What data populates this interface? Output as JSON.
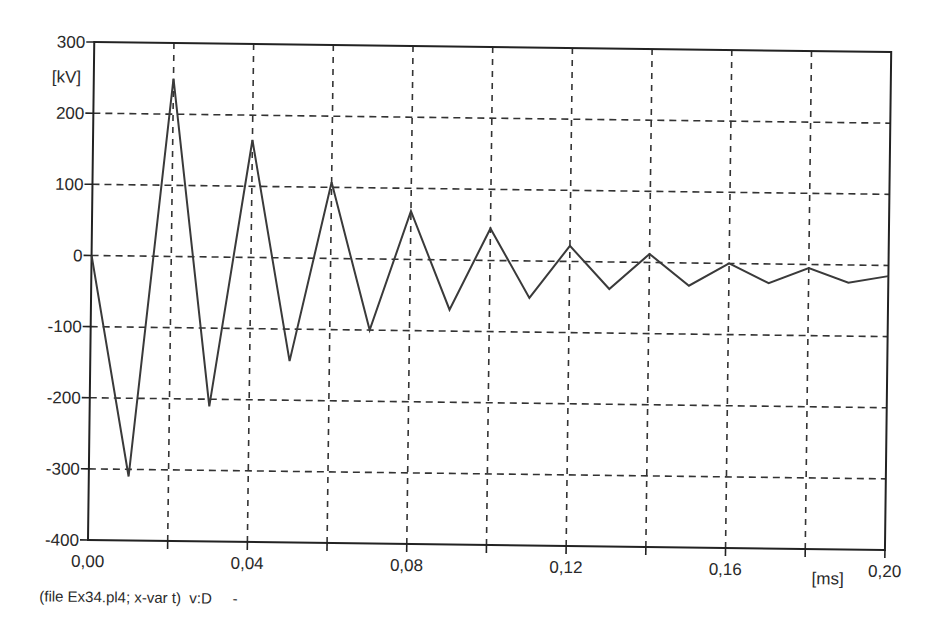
{
  "chart_data": {
    "type": "line",
    "title": "",
    "xlabel": "[ms]",
    "ylabel": "[kV]",
    "xlim": [
      0.0,
      0.2
    ],
    "ylim": [
      -400,
      300
    ],
    "grid": true,
    "x_ticks": [
      "0,00",
      "0,04",
      "0,08",
      "0,12",
      "0,16",
      "0,20"
    ],
    "x_tick_values": [
      0.0,
      0.04,
      0.08,
      0.12,
      0.16,
      0.2
    ],
    "x_gridlines": [
      0.02,
      0.04,
      0.06,
      0.08,
      0.1,
      0.12,
      0.14,
      0.16,
      0.18
    ],
    "y_ticks": [
      "300",
      "200",
      "100",
      "0",
      "-100",
      "-200",
      "-300",
      "-400"
    ],
    "y_tick_values": [
      300,
      200,
      100,
      0,
      -100,
      -200,
      -300,
      -400
    ],
    "series": [
      {
        "name": "v:D",
        "x": [
          0.0,
          0.01,
          0.02,
          0.03,
          0.04,
          0.05,
          0.06,
          0.07,
          0.08,
          0.09,
          0.1,
          0.11,
          0.12,
          0.13,
          0.14,
          0.15,
          0.16,
          0.17,
          0.18,
          0.19,
          0.2
        ],
        "values": [
          0,
          -310,
          250,
          -210,
          165,
          -145,
          107,
          -100,
          68,
          -70,
          45,
          -52,
          22,
          -38,
          12,
          -32,
          0,
          -27,
          -5,
          -25,
          -15
        ]
      }
    ],
    "caption": "(file Ex34.pl4; x-var t)  v:D     -",
    "legend": null
  },
  "labels": {
    "y_unit": "[kV]",
    "x_unit": "[ms]",
    "caption": "(file Ex34.pl4; x-var t)  v:D     -"
  }
}
